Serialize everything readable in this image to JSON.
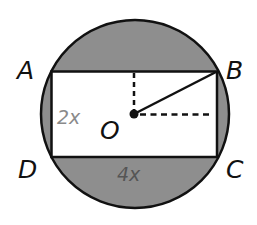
{
  "figure": {
    "colors": {
      "segment_fill": "#8e8e8e",
      "rectangle_fill": "#ffffff",
      "stroke": "#111111",
      "side_label_light": "#8a8a8a",
      "side_label_dark": "#555555"
    },
    "vertices": {
      "A": "A",
      "B": "B",
      "C": "C",
      "D": "D"
    },
    "center": {
      "label": "O"
    },
    "dimensions": {
      "height_label": "2x",
      "width_label": "4x"
    }
  }
}
